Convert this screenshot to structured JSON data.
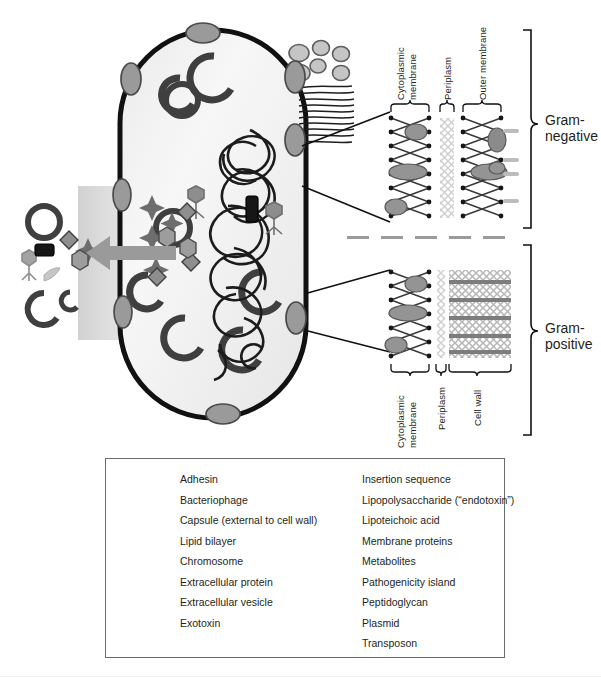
{
  "figure": {
    "cell_name": "bacterial-cell",
    "divider_name": "gram-type-divider"
  },
  "colors": {
    "outline": "#111111",
    "adhesin_fill": "#9a9a9a",
    "membrane_protein": "#949494",
    "lps": "#b9b9b9",
    "lipoteichoic_acid": "#7d7d7d",
    "peptidoglycan": "#c2c2c2",
    "capsule": "#cdcdcd",
    "cytoplasm": "#f2f2f2",
    "legend_border": "#6b6b6b",
    "divider": "#9b9b9b"
  },
  "gram_negative": {
    "section_label": "Gram-\nnegative",
    "section_label_line1": "Gram-",
    "section_label_line2": "negative",
    "layers": [
      {
        "id": "cytoplasmic-membrane",
        "label_line1": "Cytoplasmic",
        "label_line2": "membrane"
      },
      {
        "id": "periplasm",
        "label_line1": "Periplasm",
        "label_line2": ""
      },
      {
        "id": "outer-membrane",
        "label_line1": "Outer membrane",
        "label_line2": ""
      }
    ]
  },
  "gram_positive": {
    "section_label_line1": "Gram-",
    "section_label_line2": "positive",
    "layers": [
      {
        "id": "cytoplasmic-membrane",
        "label_line1": "Cytoplasmic",
        "label_line2": "membrane"
      },
      {
        "id": "periplasm",
        "label_line1": "Periplasm",
        "label_line2": ""
      },
      {
        "id": "cell-wall",
        "label_line1": "Cell wall",
        "label_line2": ""
      }
    ]
  },
  "legend": {
    "left_column": [
      {
        "icon": "adhesin-icon",
        "label": "Adhesin"
      },
      {
        "icon": "bacteriophage-icon",
        "label": "Bacteriophage"
      },
      {
        "icon": "capsule-icon",
        "label": "Capsule (external to cell wall)"
      },
      {
        "icon": "lipid-bilayer-icon",
        "label": "Lipid bilayer"
      },
      {
        "icon": "chromosome-icon",
        "label": "Chromosome"
      },
      {
        "icon": "extracellular-protein-icon",
        "label": "Extracellular protein"
      },
      {
        "icon": "extracellular-vesicle-icon",
        "label": "Extracellular vesicle"
      },
      {
        "icon": "exotoxin-icon",
        "label": "Exotoxin"
      },
      {
        "icon": "flagella-icon",
        "label": ""
      }
    ],
    "right_column": [
      {
        "icon": "insertion-sequence-icon",
        "label": "Insertion sequence"
      },
      {
        "icon": "lipopolysaccharide-icon",
        "label": "Lipopolysaccharide (“endotoxin”)"
      },
      {
        "icon": "lipoteichoic-acid-icon",
        "label": "Lipoteichoic acid"
      },
      {
        "icon": "membrane-proteins-icon",
        "label": "Membrane proteins"
      },
      {
        "icon": "metabolites-icon",
        "label": "Metabolites"
      },
      {
        "icon": "pathogenicity-island-icon",
        "label": "Pathogenicity island"
      },
      {
        "icon": "peptidoglycan-icon",
        "label": "Peptidoglycan"
      },
      {
        "icon": "plasmid-icon",
        "label": "Plasmid"
      },
      {
        "icon": "transposon-icon",
        "label": "Transposon"
      }
    ]
  }
}
